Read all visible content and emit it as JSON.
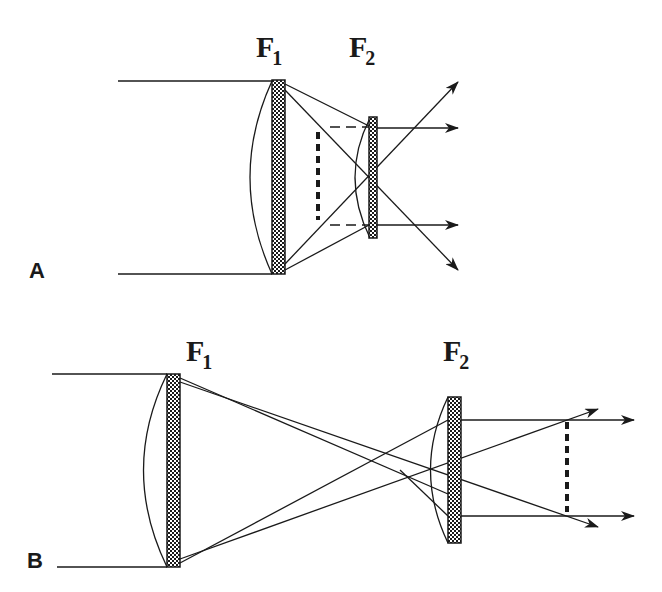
{
  "figure": {
    "panels": [
      {
        "id": "A",
        "label": "A",
        "lens1": {
          "name": "F",
          "sub": "1"
        },
        "lens2": {
          "name": "F",
          "sub": "2"
        },
        "description": "Short focal length lens F2 placed before focus of F1 (Galilean-like beam expander with divergent crossing rays)"
      },
      {
        "id": "B",
        "label": "B",
        "lens1": {
          "name": "F",
          "sub": "1"
        },
        "lens2": {
          "name": "F",
          "sub": "2"
        },
        "description": "Lens F2 placed after focus of F1 (Keplerian-like beam arrangement)"
      }
    ],
    "colors": {
      "line": "#1a1a1a",
      "background": "#ffffff"
    }
  }
}
